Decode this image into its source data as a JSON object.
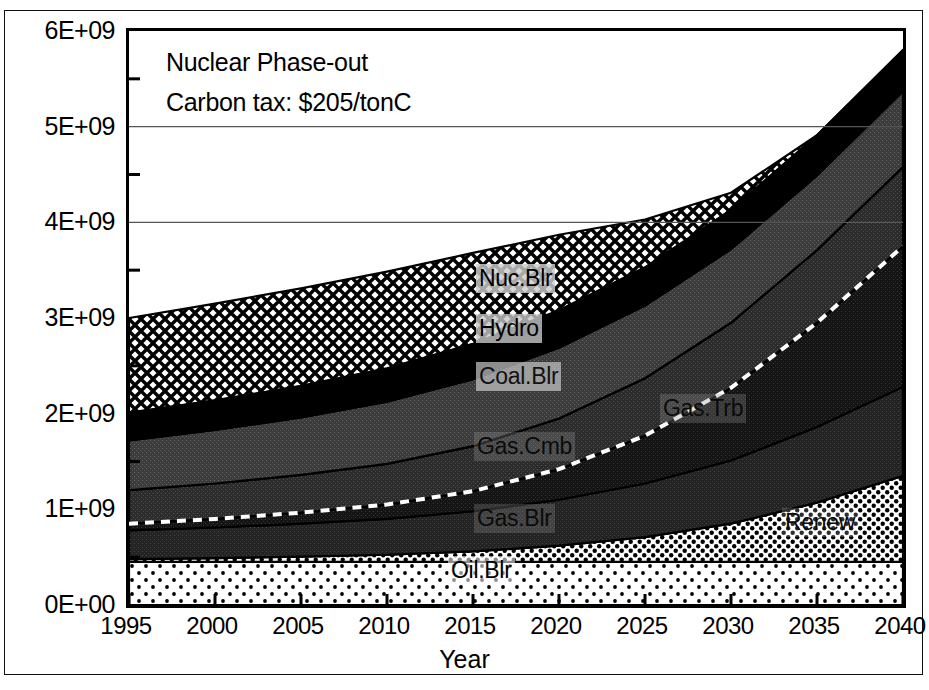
{
  "annotation": {
    "line1": "Nuclear Phase-out",
    "line2": "Carbon tax:  $205/tonC"
  },
  "axes": {
    "x_title": "Year",
    "y_ticks": [
      "0E+00",
      "1E+09",
      "2E+09",
      "3E+09",
      "4E+09",
      "5E+09",
      "6E+09"
    ],
    "x_ticks": [
      "1995",
      "2000",
      "2005",
      "2010",
      "2015",
      "2020",
      "2025",
      "2030",
      "2035",
      "2040"
    ]
  },
  "series_labels": {
    "oil": "Oil.Blr",
    "renew": "Renew",
    "gas_trb": "Gas.Trb",
    "gas_blr": "Gas.Blr",
    "gas_cmb": "Gas.Cmb",
    "coal": "Coal.Blr",
    "hydro": "Hydro",
    "nuc": "Nuc.Blr"
  },
  "chart_data": {
    "type": "area",
    "stacked": true,
    "title": "Nuclear Phase-out",
    "subtitle": "Carbon tax:  $205/tonC",
    "xlabel": "Year",
    "ylabel": "",
    "xlim": [
      1995,
      2040
    ],
    "ylim": [
      0,
      6000000000
    ],
    "grid": true,
    "legend": "inline-annotations",
    "x": [
      1995,
      2000,
      2005,
      2010,
      2015,
      2020,
      2025,
      2030,
      2035,
      2040
    ],
    "series": [
      {
        "name": "Oil.Blr",
        "values": [
          450000000,
          450000000,
          450000000,
          450000000,
          450000000,
          450000000,
          450000000,
          450000000,
          450000000,
          450000000
        ]
      },
      {
        "name": "Renew",
        "values": [
          30000000,
          40000000,
          55000000,
          75000000,
          110000000,
          170000000,
          260000000,
          400000000,
          620000000,
          900000000
        ]
      },
      {
        "name": "Gas.Blr",
        "values": [
          300000000,
          320000000,
          345000000,
          375000000,
          420000000,
          480000000,
          560000000,
          660000000,
          790000000,
          930000000
        ]
      },
      {
        "name": "Gas.Trb",
        "values": [
          70000000,
          90000000,
          115000000,
          150000000,
          210000000,
          320000000,
          500000000,
          760000000,
          1090000000,
          1470000000
        ]
      },
      {
        "name": "Gas.Cmb",
        "values": [
          350000000,
          370000000,
          395000000,
          425000000,
          470000000,
          530000000,
          600000000,
          680000000,
          760000000,
          830000000
        ]
      },
      {
        "name": "Coal.Blr",
        "values": [
          520000000,
          560000000,
          600000000,
          650000000,
          700000000,
          740000000,
          760000000,
          770000000,
          780000000,
          790000000
        ]
      },
      {
        "name": "Hydro",
        "values": [
          290000000,
          310000000,
          330000000,
          350000000,
          370000000,
          390000000,
          400000000,
          410000000,
          420000000,
          430000000
        ]
      },
      {
        "name": "Nuc.Blr",
        "values": [
          990000000,
          1010000000,
          1020000000,
          1010000000,
          950000000,
          790000000,
          500000000,
          180000000,
          0,
          0
        ]
      }
    ]
  }
}
